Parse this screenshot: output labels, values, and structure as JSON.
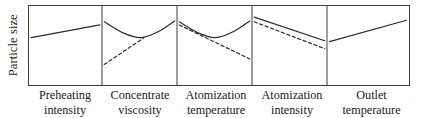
{
  "figure": {
    "y_axis_label": "Particle size",
    "frame": {
      "x": 28,
      "y": 5,
      "width": 382,
      "height": 81
    },
    "panel_dividers_x": [
      102,
      177,
      252,
      327
    ],
    "line_color": "#2b2b2b",
    "frame_color": "#3d3d3d",
    "background": "#ffffff"
  },
  "chart_data": {
    "type": "line",
    "title": "",
    "xlabel": "",
    "ylabel": "Particle size",
    "grid": false,
    "legend": "none",
    "axis_ticks": "none",
    "note": "Five-panel main-effects plot; each panel plots particle size against one process factor. Solid and dashed traces are two response trends.",
    "panels": [
      {
        "index": 1,
        "factor_label_line1": "Preheating",
        "factor_label_line2": "intensity",
        "x_range": [
          0,
          1
        ],
        "y_range": [
          0,
          1
        ],
        "series": [
          {
            "name": "solid",
            "style": "solid",
            "shape": "increasing-linear",
            "points": [
              [
                0.03,
                0.6
              ],
              [
                0.97,
                0.76
              ]
            ]
          }
        ]
      },
      {
        "index": 2,
        "factor_label_line1": "Concentrate",
        "factor_label_line2": "viscosity",
        "x_range": [
          0,
          1
        ],
        "y_range": [
          0,
          1
        ],
        "series": [
          {
            "name": "solid",
            "style": "solid",
            "shape": "u-shaped-minimum",
            "points": [
              [
                0.03,
                0.8
              ],
              [
                0.28,
                0.66
              ],
              [
                0.52,
                0.6
              ],
              [
                0.76,
                0.68
              ],
              [
                0.97,
                0.81
              ]
            ]
          },
          {
            "name": "dashed",
            "style": "dashed",
            "shape": "increasing-linear",
            "points": [
              [
                0.03,
                0.26
              ],
              [
                0.55,
                0.59
              ]
            ]
          }
        ]
      },
      {
        "index": 3,
        "factor_label_line1": "Atomization",
        "factor_label_line2": "temperature",
        "x_range": [
          0,
          1
        ],
        "y_range": [
          0,
          1
        ],
        "series": [
          {
            "name": "solid",
            "style": "solid",
            "shape": "u-shaped-minimum",
            "points": [
              [
                0.03,
                0.8
              ],
              [
                0.28,
                0.66
              ],
              [
                0.52,
                0.6
              ],
              [
                0.76,
                0.68
              ],
              [
                0.97,
                0.81
              ]
            ]
          },
          {
            "name": "dashed",
            "style": "dashed",
            "shape": "decreasing-linear",
            "points": [
              [
                0.03,
                0.76
              ],
              [
                0.97,
                0.33
              ]
            ]
          }
        ]
      },
      {
        "index": 4,
        "factor_label_line1": "Atomization",
        "factor_label_line2": "intensity",
        "x_range": [
          0,
          1
        ],
        "y_range": [
          0,
          1
        ],
        "series": [
          {
            "name": "solid",
            "style": "solid",
            "shape": "decreasing-linear",
            "points": [
              [
                0.03,
                0.86
              ],
              [
                0.97,
                0.56
              ]
            ]
          },
          {
            "name": "dashed",
            "style": "dashed",
            "shape": "decreasing-linear",
            "points": [
              [
                0.03,
                0.8
              ],
              [
                0.97,
                0.46
              ]
            ]
          }
        ]
      },
      {
        "index": 5,
        "factor_label_line1": "Outlet",
        "factor_label_line2": "temperature",
        "x_range": [
          0,
          1
        ],
        "y_range": [
          0,
          1
        ],
        "series": [
          {
            "name": "solid",
            "style": "solid",
            "shape": "increasing-linear",
            "points": [
              [
                0.03,
                0.55
              ],
              [
                0.97,
                0.82
              ]
            ]
          }
        ]
      }
    ]
  }
}
